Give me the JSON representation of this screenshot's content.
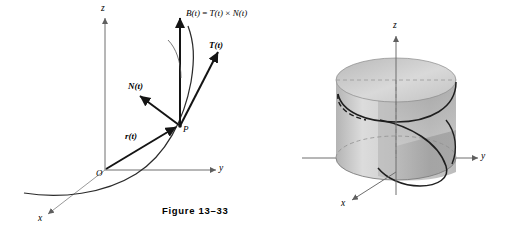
{
  "figures": [
    {
      "id": "figure-13-33",
      "caption": "Figure 13–33",
      "description": "Space curve in 3D with position vector and Frenet frame at point P",
      "axes": {
        "x": "x",
        "y": "y",
        "z": "z"
      },
      "labels": {
        "origin": "O",
        "point": "P",
        "position_vector": "r(t)",
        "tangent_vector": "T(t)",
        "normal_vector": "N(t)",
        "binormal_formula_lhs": "B(t)",
        "binormal_formula_eq": "=",
        "binormal_formula_t": "T(t)",
        "binormal_formula_cross": "×",
        "binormal_formula_n": "N(t)"
      }
    },
    {
      "id": "figure-13-34",
      "caption": "Figure 13–34",
      "description": "Circular cylinder with a helix curve and shaded helicoid surface",
      "axes": {
        "x": "x",
        "y": "y",
        "z": "z"
      }
    }
  ],
  "colors": {
    "ink": "#1a1a1a",
    "axis": "#6e6e6e",
    "curve": "#2b2b2b",
    "cylinder_light": "#e3e3e3",
    "cylinder_mid": "#c9c9c9",
    "cylinder_dark": "#a9a9a9",
    "surface_shade": "#b5b5b5",
    "background": "#ffffff"
  }
}
